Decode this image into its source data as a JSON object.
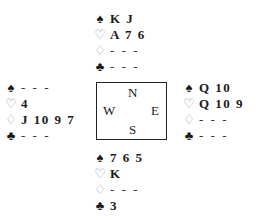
{
  "hands": {
    "north": {
      "spades": "K J",
      "hearts": "A 7 6",
      "diamonds": "- - -",
      "clubs": "- - -"
    },
    "west": {
      "spades": "- - -",
      "hearts": "4",
      "diamonds": "J 10 9 7",
      "clubs": "- - -"
    },
    "east": {
      "spades": "Q 10",
      "hearts": "Q 10 9",
      "diamonds": "- - -",
      "clubs": "- - -"
    },
    "south": {
      "spades": "7 6 5",
      "hearts": "K",
      "diamonds": "- - -",
      "clubs": "3"
    }
  },
  "suit_symbols": {
    "spades": "♠",
    "hearts": "♡",
    "diamonds": "♢",
    "clubs": "♣"
  },
  "compass": {
    "north": "N",
    "south": "S",
    "west": "W",
    "east": "E"
  }
}
